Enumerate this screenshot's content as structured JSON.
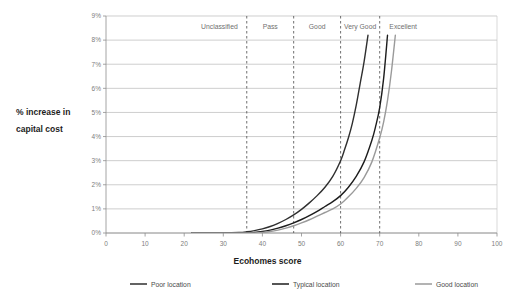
{
  "chart_data": {
    "type": "line",
    "title": "",
    "xlabel": "Ecohomes score",
    "ylabel": "% increase in capital cost",
    "ylabel_line1": "% increase in",
    "ylabel_line2": "capital cost",
    "xlim": [
      0,
      100
    ],
    "ylim": [
      0,
      9
    ],
    "xticks": [
      0,
      10,
      20,
      30,
      40,
      50,
      60,
      70,
      80,
      90,
      100
    ],
    "xtick_labels": [
      "0",
      "10",
      "20",
      "30",
      "40",
      "50",
      "60",
      "70",
      "80",
      "90",
      "100"
    ],
    "yticks": [
      0,
      1,
      2,
      3,
      4,
      5,
      6,
      7,
      8,
      9
    ],
    "ytick_labels": [
      "0%",
      "1%",
      "2%",
      "3%",
      "4%",
      "5%",
      "6%",
      "7%",
      "8%",
      "9%"
    ],
    "grid": true,
    "legend_position": "bottom",
    "bands": [
      {
        "label": "Unclassified",
        "start": 22,
        "end": 36,
        "center": 29
      },
      {
        "label": "Pass",
        "start": 36,
        "end": 48,
        "center": 42
      },
      {
        "label": "Good",
        "start": 48,
        "end": 60,
        "center": 54
      },
      {
        "label": "Very Good",
        "start": 60,
        "end": 70,
        "center": 65
      },
      {
        "label": "Excellent",
        "start": 70,
        "end": 82,
        "center": 76
      }
    ],
    "band_dividers": [
      36,
      48,
      60,
      70
    ],
    "series": [
      {
        "name": "Poor location",
        "color": "#2f2f2f",
        "x": [
          22,
          26,
          30,
          34,
          36,
          38,
          40,
          42,
          44,
          46,
          48,
          50,
          52,
          54,
          56,
          58,
          60,
          61,
          62,
          63,
          64,
          65,
          66,
          67
        ],
        "values": [
          0.0,
          0.0,
          0.0,
          0.02,
          0.05,
          0.1,
          0.17,
          0.27,
          0.4,
          0.56,
          0.75,
          0.98,
          1.25,
          1.55,
          1.9,
          2.35,
          3.0,
          3.45,
          3.95,
          4.55,
          5.3,
          6.2,
          7.1,
          8.2
        ]
      },
      {
        "name": "Typical location",
        "color": "#1c1c1c",
        "x": [
          22,
          28,
          32,
          36,
          38,
          40,
          42,
          44,
          46,
          48,
          50,
          52,
          54,
          56,
          58,
          60,
          62,
          64,
          66,
          68,
          69,
          70,
          71,
          72
        ],
        "values": [
          0.0,
          0.0,
          0.0,
          0.0,
          0.02,
          0.06,
          0.12,
          0.2,
          0.3,
          0.42,
          0.56,
          0.72,
          0.9,
          1.1,
          1.3,
          1.55,
          1.9,
          2.35,
          2.95,
          3.85,
          4.45,
          5.2,
          6.4,
          8.2
        ]
      },
      {
        "name": "Good location",
        "color": "#9a9a9a",
        "x": [
          22,
          28,
          32,
          36,
          38,
          40,
          42,
          44,
          46,
          48,
          50,
          52,
          54,
          56,
          58,
          60,
          62,
          64,
          66,
          68,
          70,
          71,
          72,
          73,
          74
        ],
        "values": [
          0.0,
          0.0,
          0.0,
          0.0,
          0.0,
          0.02,
          0.06,
          0.12,
          0.2,
          0.3,
          0.42,
          0.55,
          0.7,
          0.85,
          1.0,
          1.2,
          1.5,
          1.85,
          2.3,
          2.95,
          3.95,
          4.6,
          5.5,
          6.7,
          8.2
        ]
      }
    ]
  },
  "legend": {
    "items": [
      {
        "label": "Poor location",
        "color": "#2f2f2f"
      },
      {
        "label": "Typical location",
        "color": "#1c1c1c"
      },
      {
        "label": "Good location",
        "color": "#9a9a9a"
      }
    ]
  }
}
